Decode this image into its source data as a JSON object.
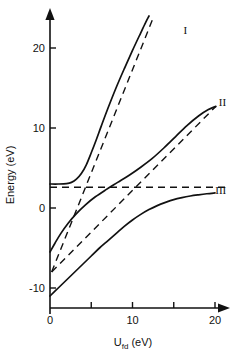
{
  "chart_data": {
    "type": "line",
    "title": "",
    "xlabel": "U_fd (eV)",
    "xlabel_base": "U",
    "xlabel_sub": "fd",
    "xlabel_unit": " (eV)",
    "ylabel": "Energy (eV)",
    "xlim": [
      0,
      21.5
    ],
    "ylim": [
      -12.5,
      23.5
    ],
    "xticks": [
      0,
      5,
      10,
      15,
      20
    ],
    "xticklabels": [
      "0",
      "",
      "10",
      "",
      "20"
    ],
    "yticks": [
      -10,
      0,
      10,
      20
    ],
    "yticklabels": [
      "-10",
      "0",
      "10",
      "20"
    ],
    "grid": false,
    "legend": "inline-curve-labels",
    "axis_style": "arrow-tipped-open-axes",
    "annotations": [
      {
        "label": "I",
        "x": 16.4,
        "y": 22.2
      },
      {
        "label": "II",
        "x": 20.9,
        "y": 13.2
      },
      {
        "label": "III",
        "x": 20.7,
        "y": 2.3
      }
    ],
    "series": [
      {
        "name": "I",
        "style": "solid",
        "description": "Upper adiabatic branch: flat near 3 eV then rising steeply",
        "points": [
          [
            0.0,
            3.0
          ],
          [
            1.0,
            3.0
          ],
          [
            2.0,
            3.05
          ],
          [
            2.6,
            3.2
          ],
          [
            3.2,
            3.6
          ],
          [
            3.8,
            4.3
          ],
          [
            4.4,
            5.4
          ],
          [
            5.0,
            6.9
          ],
          [
            5.6,
            8.5
          ],
          [
            6.2,
            10.2
          ],
          [
            7.0,
            12.4
          ],
          [
            8.0,
            15.0
          ],
          [
            9.0,
            17.4
          ],
          [
            10.0,
            19.7
          ],
          [
            11.0,
            21.9
          ],
          [
            11.6,
            23.2
          ],
          [
            12.0,
            24.0
          ]
        ]
      },
      {
        "name": "II",
        "style": "solid",
        "description": "Middle branch rising from -5.5 eV to about 12.5 eV",
        "points": [
          [
            0.0,
            -5.5
          ],
          [
            0.6,
            -4.4
          ],
          [
            1.3,
            -3.2
          ],
          [
            2.2,
            -1.9
          ],
          [
            3.2,
            -0.7
          ],
          [
            4.3,
            0.4
          ],
          [
            5.5,
            1.4
          ],
          [
            6.8,
            2.3
          ],
          [
            8.2,
            3.2
          ],
          [
            9.6,
            4.1
          ],
          [
            11.0,
            5.1
          ],
          [
            12.4,
            6.2
          ],
          [
            13.8,
            7.5
          ],
          [
            15.2,
            8.9
          ],
          [
            16.6,
            10.3
          ],
          [
            18.0,
            11.5
          ],
          [
            19.2,
            12.3
          ],
          [
            20.1,
            12.7
          ]
        ]
      },
      {
        "name": "III",
        "style": "solid",
        "description": "Lower branch rising from -11 eV and saturating near 1.9 eV",
        "points": [
          [
            0.0,
            -11.0
          ],
          [
            1.0,
            -10.0
          ],
          [
            2.0,
            -9.0
          ],
          [
            3.0,
            -8.0
          ],
          [
            4.0,
            -7.0
          ],
          [
            5.0,
            -6.0
          ],
          [
            6.0,
            -5.0
          ],
          [
            7.0,
            -4.1
          ],
          [
            8.0,
            -3.2
          ],
          [
            9.0,
            -2.3
          ],
          [
            10.0,
            -1.5
          ],
          [
            11.0,
            -0.8
          ],
          [
            12.0,
            -0.2
          ],
          [
            13.0,
            0.3
          ],
          [
            14.0,
            0.7
          ],
          [
            15.0,
            1.05
          ],
          [
            16.0,
            1.3
          ],
          [
            17.0,
            1.5
          ],
          [
            18.0,
            1.65
          ],
          [
            19.0,
            1.78
          ],
          [
            20.0,
            1.88
          ]
        ]
      }
    ],
    "asymptotes": [
      {
        "name": "horizontal-diabatic-level",
        "style": "dashed",
        "description": "Constant level near 2.6 eV spanning full width",
        "points": [
          [
            0.0,
            2.6
          ],
          [
            21.3,
            2.6
          ]
        ]
      },
      {
        "name": "steep-diabatic-line",
        "style": "dashed",
        "description": "Steep straight line from -8 eV asymptotic to branch I",
        "points": [
          [
            0.2,
            -8.0
          ],
          [
            12.6,
            24.0
          ]
        ]
      },
      {
        "name": "shallow-diabatic-line",
        "style": "dashed",
        "description": "Shallow straight line from -8 eV asymptotic to branch II",
        "points": [
          [
            0.2,
            -8.0
          ],
          [
            20.1,
            12.7
          ]
        ]
      }
    ]
  },
  "axes": {
    "x_title_parts": {
      "base": "U",
      "sub": "fd",
      "unit": " (eV)"
    },
    "y_title": "Energy (eV)"
  }
}
